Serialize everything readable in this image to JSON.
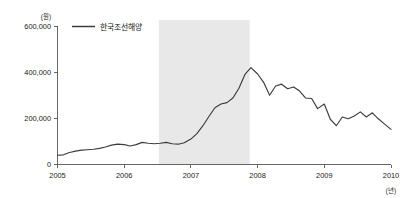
{
  "chart_data": {
    "type": "line",
    "title": "",
    "subtitle": "",
    "xlabel": "(년)",
    "ylabel": "(원)",
    "xlim": [
      2005,
      2010
    ],
    "ylim": [
      0,
      600000
    ],
    "grid": false,
    "legend_position": "top-left",
    "legend": [
      "한국조선해양"
    ],
    "y_ticks": [
      0,
      200000,
      400000,
      600000
    ],
    "y_tick_labels": [
      "0",
      "200,000",
      "400,000",
      "600,000"
    ],
    "x_ticks": [
      2005,
      2006,
      2007,
      2008,
      2009,
      2010
    ],
    "x_tick_labels": [
      "2005",
      "2006",
      "2007",
      "2008",
      "2009",
      "2010"
    ],
    "annotations": [
      {
        "type": "vertical-band",
        "name": "highlight-band",
        "x_start": 2006.52,
        "x_end": 2007.88,
        "color": "#e8e8e8"
      }
    ],
    "series": [
      {
        "name": "한국조선해양",
        "color": "#3c3c3c",
        "x": [
          2005.0,
          2005.09,
          2005.18,
          2005.27,
          2005.36,
          2005.45,
          2005.54,
          2005.63,
          2005.72,
          2005.81,
          2005.9,
          2006.0,
          2006.09,
          2006.18,
          2006.27,
          2006.36,
          2006.45,
          2006.54,
          2006.63,
          2006.72,
          2006.81,
          2006.9,
          2007.0,
          2007.09,
          2007.18,
          2007.27,
          2007.36,
          2007.45,
          2007.54,
          2007.63,
          2007.72,
          2007.81,
          2007.9,
          2008.0,
          2008.09,
          2008.18,
          2008.27,
          2008.36,
          2008.45,
          2008.54,
          2008.63,
          2008.72,
          2008.81,
          2008.9,
          2009.0,
          2009.09,
          2009.18,
          2009.27,
          2009.36,
          2009.45,
          2009.54,
          2009.63,
          2009.72,
          2009.81,
          2009.9,
          2010.0
        ],
        "values": [
          40000,
          42000,
          52000,
          58000,
          62000,
          64000,
          66000,
          70000,
          76000,
          84000,
          88000,
          86000,
          80000,
          86000,
          96000,
          92000,
          90000,
          92000,
          96000,
          90000,
          88000,
          94000,
          110000,
          134000,
          168000,
          208000,
          246000,
          262000,
          268000,
          288000,
          330000,
          390000,
          420000,
          392000,
          356000,
          300000,
          340000,
          348000,
          328000,
          336000,
          318000,
          288000,
          286000,
          242000,
          262000,
          196000,
          168000,
          206000,
          198000,
          210000,
          228000,
          206000,
          224000,
          198000,
          176000,
          152000
        ]
      }
    ]
  },
  "meta": {
    "y_unit_label": "(원)",
    "x_unit_label": "(년)"
  }
}
